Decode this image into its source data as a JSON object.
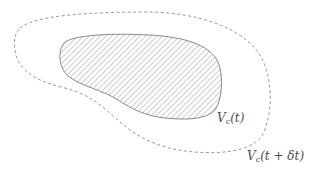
{
  "diagram": {
    "regions": [
      {
        "id": "inner",
        "style": "hatched, solid gray outline",
        "label": {
          "symbol": "V",
          "subscript": "c",
          "argument": "(t)"
        }
      },
      {
        "id": "outer",
        "style": "dashed gray outline, no fill",
        "label": {
          "symbol": "V",
          "subscript": "c",
          "argument": "(t + δt)"
        }
      }
    ],
    "colors": {
      "outline": "#8a8a8a",
      "hatch": "#9a9a9a",
      "dashed": "#9a9a9a",
      "text": "#4a4a4a",
      "background": "#ffffff"
    }
  }
}
